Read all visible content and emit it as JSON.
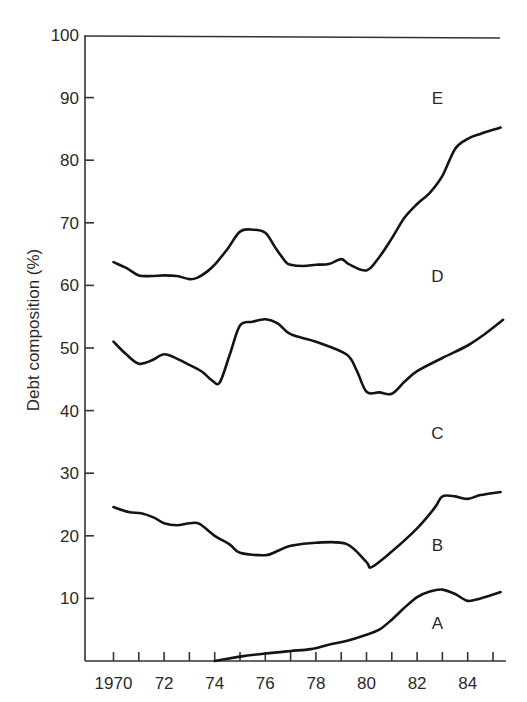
{
  "chart_data": {
    "type": "area",
    "subtype": "stacked-cumulative-lines",
    "title": "",
    "xlabel": "",
    "ylabel": "Debt composition (%)",
    "xlim": [
      1969.3,
      1985.6
    ],
    "ylim": [
      0,
      100
    ],
    "grid": false,
    "legend": "none (regions labeled inline A–E)",
    "x_ticks": [
      1970,
      1971,
      1972,
      1973,
      1974,
      1975,
      1976,
      1977,
      1978,
      1979,
      1980,
      1981,
      1982,
      1983,
      1984,
      1985
    ],
    "x_tick_labels": [
      {
        "x": 1970,
        "label": "1970"
      },
      {
        "x": 1972,
        "label": "72"
      },
      {
        "x": 1974,
        "label": "74"
      },
      {
        "x": 1976,
        "label": "76"
      },
      {
        "x": 1978,
        "label": "78"
      },
      {
        "x": 1980,
        "label": "80"
      },
      {
        "x": 1982,
        "label": "82"
      },
      {
        "x": 1984,
        "label": "84"
      }
    ],
    "y_ticks": [
      10,
      20,
      30,
      40,
      50,
      60,
      70,
      80,
      90,
      100
    ],
    "y_tick_labels": [
      "10",
      "20",
      "30",
      "40",
      "50",
      "60",
      "70",
      "80",
      "90",
      "100"
    ],
    "region_labels": [
      {
        "label": "A",
        "x": 1982.8,
        "y": 6
      },
      {
        "label": "B",
        "x": 1982.8,
        "y": 18.5
      },
      {
        "label": "C",
        "x": 1982.8,
        "y": 36.5
      },
      {
        "label": "D",
        "x": 1982.8,
        "y": 61.5
      },
      {
        "label": "E",
        "x": 1982.8,
        "y": 90
      }
    ],
    "series": [
      {
        "name": "A/B boundary",
        "x": [
          1974.0,
          1975.0,
          1976.0,
          1977.0,
          1977.8,
          1978.5,
          1979.2,
          1980.0,
          1980.5,
          1981.0,
          1981.5,
          1982.0,
          1982.5,
          1983.0,
          1983.5,
          1984.0,
          1984.5,
          1985.3
        ],
        "values": [
          0.0,
          0.7,
          1.2,
          1.6,
          1.9,
          2.6,
          3.2,
          4.2,
          5.0,
          6.6,
          8.5,
          10.2,
          11.1,
          11.4,
          10.7,
          9.6,
          10.0,
          11.0
        ]
      },
      {
        "name": "B/C boundary",
        "x": [
          1970.0,
          1970.6,
          1971.1,
          1971.6,
          1972.0,
          1972.5,
          1973.0,
          1973.4,
          1974.0,
          1974.6,
          1975.0,
          1976.0,
          1976.5,
          1977.0,
          1978.0,
          1979.2,
          1980.0,
          1980.2,
          1981.0,
          1982.0,
          1982.7,
          1983.0,
          1983.5,
          1984.0,
          1984.5,
          1985.3
        ],
        "values": [
          24.6,
          23.8,
          23.6,
          22.9,
          22.0,
          21.7,
          22.0,
          21.9,
          20.0,
          18.6,
          17.3,
          16.9,
          17.6,
          18.4,
          18.9,
          18.7,
          15.8,
          15.0,
          17.5,
          21.2,
          24.5,
          26.3,
          26.3,
          25.9,
          26.5,
          27.0
        ]
      },
      {
        "name": "C/D boundary",
        "x": [
          1970.0,
          1970.5,
          1971.0,
          1971.5,
          1972.0,
          1972.5,
          1973.0,
          1973.5,
          1973.9,
          1974.2,
          1974.6,
          1975.0,
          1975.5,
          1976.0,
          1976.5,
          1977.0,
          1978.0,
          1979.2,
          1979.6,
          1980.0,
          1980.5,
          1981.0,
          1981.5,
          1982.0,
          1983.0,
          1984.0,
          1984.6,
          1985.4
        ],
        "values": [
          51.0,
          49.0,
          47.5,
          48.0,
          49.0,
          48.3,
          47.3,
          46.2,
          44.8,
          44.5,
          49.0,
          53.6,
          54.2,
          54.6,
          53.9,
          52.2,
          51.0,
          49.0,
          46.5,
          43.0,
          42.9,
          42.7,
          44.6,
          46.3,
          48.4,
          50.4,
          52.0,
          54.5
        ]
      },
      {
        "name": "D/E boundary",
        "x": [
          1970.0,
          1970.5,
          1971.0,
          1971.5,
          1972.0,
          1972.5,
          1973.0,
          1973.3,
          1973.7,
          1974.0,
          1974.5,
          1975.0,
          1975.5,
          1976.0,
          1976.4,
          1976.8,
          1977.0,
          1977.5,
          1978.0,
          1978.5,
          1979.0,
          1979.3,
          1980.0,
          1980.5,
          1981.0,
          1981.5,
          1982.0,
          1982.5,
          1983.0,
          1983.5,
          1984.0,
          1984.5,
          1985.3
        ],
        "values": [
          63.7,
          62.8,
          61.6,
          61.5,
          61.6,
          61.5,
          61.0,
          61.2,
          62.2,
          63.3,
          65.8,
          68.6,
          68.9,
          68.4,
          66.0,
          63.8,
          63.3,
          63.1,
          63.3,
          63.4,
          64.2,
          63.4,
          62.4,
          64.5,
          67.5,
          70.8,
          73.0,
          74.8,
          77.5,
          81.8,
          83.4,
          84.2,
          85.2
        ]
      }
    ]
  }
}
